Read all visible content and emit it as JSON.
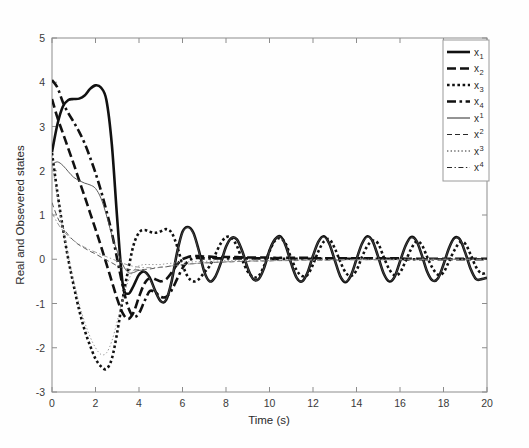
{
  "figure": {
    "background": "#ffffff",
    "axis_color": "#8c8c8c",
    "curve_color": "#111111"
  },
  "axes": {
    "xlabel": "Time (s)",
    "ylabel": "Real and Obsevered states",
    "xticks": [
      "0",
      "2",
      "4",
      "6",
      "8",
      "10",
      "12",
      "14",
      "16",
      "18",
      "20"
    ],
    "yticks": [
      "5",
      "4",
      "3",
      "2",
      "1",
      "0",
      "-1",
      "-2",
      "-3"
    ]
  },
  "legend": {
    "entries": [
      {
        "base": "x",
        "sub": "1",
        "sup": "",
        "style": "solid",
        "weight": "thick"
      },
      {
        "base": "x",
        "sub": "2",
        "sup": "",
        "style": "dashed",
        "weight": "thick"
      },
      {
        "base": "x",
        "sub": "3",
        "sup": "",
        "style": "dotted",
        "weight": "thick"
      },
      {
        "base": "x",
        "sub": "4",
        "sup": "",
        "style": "dashdot",
        "weight": "thick"
      },
      {
        "base": "x",
        "sub": "",
        "sup": "1",
        "style": "solid",
        "weight": "thin"
      },
      {
        "base": "x",
        "sub": "",
        "sup": "2",
        "style": "dashed",
        "weight": "thin"
      },
      {
        "base": "x",
        "sub": "",
        "sup": "3",
        "style": "dotted",
        "weight": "thin"
      },
      {
        "base": "x",
        "sub": "",
        "sup": "4",
        "style": "dashdot",
        "weight": "thin"
      }
    ]
  },
  "chart_data": {
    "type": "line",
    "title": "",
    "xlabel": "Time (s)",
    "ylabel": "Real and Obsevered states",
    "xlim": [
      0,
      20
    ],
    "ylim": [
      -3,
      5
    ],
    "xticks": [
      0,
      2,
      4,
      6,
      8,
      10,
      12,
      14,
      16,
      18,
      20
    ],
    "yticks": [
      -3,
      -2,
      -1,
      0,
      1,
      2,
      3,
      4,
      5
    ],
    "grid": false,
    "legend_position": "top-right",
    "x": [
      0,
      0.25,
      0.5,
      0.75,
      1,
      1.25,
      1.5,
      1.75,
      2,
      2.25,
      2.5,
      2.75,
      3,
      3.25,
      3.5,
      3.75,
      4,
      4.25,
      4.5,
      4.75,
      5,
      5.25,
      5.5,
      5.75,
      6,
      6.25,
      6.5,
      6.75,
      7,
      7.25,
      7.5,
      7.75,
      8,
      8.25,
      8.5,
      8.75,
      9,
      9.25,
      9.5,
      9.75,
      10,
      10.25,
      10.5,
      10.75,
      11,
      11.25,
      11.5,
      11.75,
      12,
      12.25,
      12.5,
      12.75,
      13,
      13.25,
      13.5,
      13.75,
      14,
      14.25,
      14.5,
      14.75,
      15,
      15.25,
      15.5,
      15.75,
      16,
      16.25,
      16.5,
      16.75,
      17,
      17.25,
      17.5,
      17.75,
      18,
      18.25,
      18.5,
      18.75,
      19,
      19.25,
      19.5,
      19.75,
      20
    ],
    "series": [
      {
        "name": "x_1",
        "label": "x1",
        "kind": "real",
        "style": "solid",
        "weight": "thick",
        "values": [
          2.42,
          3.05,
          3.45,
          3.6,
          3.62,
          3.63,
          3.7,
          3.85,
          3.93,
          3.88,
          3.6,
          2.6,
          0.9,
          -0.55,
          -0.78,
          -0.6,
          -0.35,
          -0.28,
          -0.42,
          -0.72,
          -0.95,
          -0.92,
          -0.5,
          0.15,
          0.62,
          0.73,
          0.6,
          0.2,
          -0.28,
          -0.5,
          -0.4,
          -0.1,
          0.28,
          0.48,
          0.45,
          0.18,
          -0.2,
          -0.45,
          -0.45,
          -0.2,
          0.2,
          0.45,
          0.52,
          0.3,
          -0.1,
          -0.42,
          -0.5,
          -0.3,
          0.08,
          0.4,
          0.52,
          0.35,
          -0.02,
          -0.38,
          -0.52,
          -0.36,
          0.0,
          0.35,
          0.52,
          0.4,
          0.05,
          -0.32,
          -0.5,
          -0.4,
          -0.05,
          0.3,
          0.5,
          0.42,
          0.1,
          -0.28,
          -0.48,
          -0.43,
          -0.12,
          0.25,
          0.48,
          0.45,
          0.15,
          -0.22,
          -0.45,
          -0.45,
          -0.42
        ]
      },
      {
        "name": "x_2",
        "label": "x2",
        "kind": "real",
        "style": "dashed",
        "weight": "thick",
        "values": [
          3.62,
          3.2,
          2.85,
          2.5,
          2.15,
          1.78,
          1.42,
          1.05,
          0.68,
          0.3,
          -0.1,
          -0.5,
          -0.9,
          -1.22,
          -1.35,
          -1.2,
          -0.85,
          -0.55,
          -0.42,
          -0.45,
          -0.5,
          -0.45,
          -0.3,
          -0.12,
          0.0,
          0.05,
          0.07,
          0.07,
          0.06,
          0.06,
          0.05,
          0.05,
          0.05,
          0.05,
          0.05,
          0.04,
          0.04,
          0.04,
          0.04,
          0.04,
          0.04,
          0.03,
          0.03,
          0.03,
          0.03,
          0.03,
          0.03,
          0.03,
          0.03,
          0.02,
          0.02,
          0.02,
          0.02,
          0.02,
          0.02,
          0.02,
          0.02,
          0.02,
          0.02,
          0.02,
          0.02,
          0.02,
          0.02,
          0.02,
          0.02,
          0.01,
          0.01,
          0.01,
          0.01,
          0.01,
          0.01,
          0.01,
          0.01,
          0.01,
          0.01,
          0.01,
          0.01,
          0.01,
          0.01,
          0.01,
          0.01
        ]
      },
      {
        "name": "x_3",
        "label": "x3",
        "kind": "real",
        "style": "dotted",
        "weight": "thick",
        "values": [
          2.4,
          1.5,
          0.7,
          0.0,
          -0.6,
          -1.15,
          -1.6,
          -1.95,
          -2.25,
          -2.42,
          -2.48,
          -2.25,
          -1.65,
          -0.9,
          -0.25,
          0.32,
          0.6,
          0.66,
          0.62,
          0.6,
          0.63,
          0.68,
          0.6,
          0.3,
          -0.12,
          -0.4,
          -0.5,
          -0.45,
          -0.3,
          -0.15,
          0.1,
          0.35,
          0.5,
          0.48,
          0.3,
          -0.02,
          -0.28,
          -0.4,
          -0.38,
          -0.15,
          0.18,
          0.42,
          0.47,
          0.35,
          0.02,
          -0.25,
          -0.38,
          -0.35,
          -0.12,
          0.18,
          0.4,
          0.45,
          0.25,
          -0.05,
          -0.3,
          -0.38,
          -0.25,
          0.05,
          0.3,
          0.42,
          0.35,
          0.05,
          -0.22,
          -0.36,
          -0.3,
          -0.05,
          0.22,
          0.4,
          0.33,
          0.05,
          -0.2,
          -0.35,
          -0.3,
          -0.05,
          0.2,
          0.38,
          0.35,
          0.1,
          -0.18,
          -0.32,
          -0.3
        ]
      },
      {
        "name": "x_4",
        "label": "x4",
        "kind": "real",
        "style": "dashdot",
        "weight": "thick",
        "values": [
          4.05,
          3.88,
          3.55,
          3.3,
          3.1,
          2.88,
          2.62,
          2.3,
          1.95,
          1.55,
          1.1,
          0.6,
          0.0,
          -0.6,
          -1.08,
          -1.3,
          -1.22,
          -0.95,
          -0.72,
          -0.75,
          -0.85,
          -0.85,
          -0.7,
          -0.45,
          -0.2,
          -0.05,
          0.02,
          0.03,
          0.02,
          0.02,
          0.02,
          0.02,
          0.02,
          0.02,
          0.02,
          0.02,
          0.02,
          0.02,
          0.02,
          0.02,
          0.02,
          0.01,
          0.01,
          0.01,
          0.01,
          0.01,
          0.01,
          0.01,
          0.01,
          0.01,
          0.01,
          0.01,
          0.01,
          0.01,
          0.01,
          0.01,
          0.01,
          0.01,
          0.01,
          0.01,
          0.01,
          0.01,
          0.01,
          0.01,
          0.01,
          0.0,
          0.0,
          0.0,
          0.0,
          0.0,
          0.0,
          0.0,
          0.0,
          0.0,
          0.0,
          0.0,
          0.0,
          0.0,
          0.0,
          0.0,
          0.0
        ]
      },
      {
        "name": "x^1",
        "label": "x1-obs",
        "kind": "observed",
        "style": "solid",
        "weight": "thin",
        "values": [
          2.15,
          2.2,
          2.12,
          1.98,
          1.85,
          1.78,
          1.72,
          1.68,
          1.6,
          1.38,
          1.0,
          0.55,
          0.18,
          -0.12,
          -0.3,
          -0.3,
          -0.25,
          -0.28,
          -0.45,
          -0.72,
          -0.95,
          -0.9,
          -0.48,
          0.15,
          0.6,
          0.72,
          0.58,
          0.18,
          -0.28,
          -0.5,
          -0.4,
          -0.1,
          0.28,
          0.48,
          0.45,
          0.18,
          -0.2,
          -0.45,
          -0.45,
          -0.2,
          0.2,
          0.45,
          0.5,
          0.3,
          -0.1,
          -0.42,
          -0.5,
          -0.3,
          0.08,
          0.4,
          0.5,
          0.35,
          -0.02,
          -0.38,
          -0.5,
          -0.36,
          0.0,
          0.35,
          0.5,
          0.4,
          0.05,
          -0.32,
          -0.48,
          -0.4,
          -0.05,
          0.3,
          0.48,
          0.42,
          0.1,
          -0.28,
          -0.48,
          -0.43,
          -0.12,
          0.25,
          0.46,
          0.45,
          0.15,
          -0.22,
          -0.45,
          -0.45,
          -0.42
        ]
      },
      {
        "name": "x^2",
        "label": "x2-obs",
        "kind": "observed",
        "style": "dashed",
        "weight": "thin",
        "values": [
          1.28,
          0.95,
          0.72,
          0.55,
          0.42,
          0.32,
          0.25,
          0.18,
          0.12,
          0.05,
          -0.02,
          -0.08,
          -0.15,
          -0.2,
          -0.23,
          -0.24,
          -0.24,
          -0.23,
          -0.22,
          -0.2,
          -0.18,
          -0.17,
          -0.15,
          -0.13,
          -0.12,
          -0.11,
          -0.1,
          -0.09,
          -0.08,
          -0.08,
          -0.07,
          -0.07,
          -0.06,
          -0.06,
          -0.05,
          -0.05,
          -0.05,
          -0.04,
          -0.04,
          -0.04,
          -0.04,
          -0.03,
          -0.03,
          -0.03,
          -0.03,
          -0.03,
          -0.02,
          -0.02,
          -0.02,
          -0.02,
          -0.02,
          -0.02,
          -0.02,
          -0.02,
          -0.01,
          -0.01,
          -0.01,
          -0.01,
          -0.01,
          -0.01,
          -0.01,
          -0.01,
          -0.01,
          -0.01,
          -0.01,
          -0.01,
          -0.01,
          -0.01,
          -0.01,
          0.0,
          0.0,
          0.0,
          0.0,
          0.0,
          0.0,
          0.0,
          0.0,
          0.0,
          0.0,
          0.0,
          0.0
        ]
      },
      {
        "name": "x^3",
        "label": "x3-obs",
        "kind": "observed",
        "style": "dotted",
        "weight": "thin",
        "values": [
          2.18,
          1.4,
          0.68,
          0.05,
          -0.5,
          -1.0,
          -1.42,
          -1.75,
          -2.0,
          -2.15,
          -2.12,
          -1.85,
          -1.4,
          -0.9,
          -0.5,
          -0.25,
          -0.15,
          -0.12,
          -0.12,
          -0.12,
          -0.12,
          -0.1,
          -0.09,
          -0.08,
          -0.07,
          -0.06,
          -0.06,
          -0.05,
          -0.05,
          -0.04,
          -0.04,
          -0.04,
          -0.03,
          -0.03,
          -0.03,
          -0.03,
          -0.02,
          -0.02,
          -0.02,
          -0.02,
          -0.02,
          -0.02,
          -0.02,
          -0.01,
          -0.01,
          -0.01,
          -0.01,
          -0.01,
          -0.01,
          -0.01,
          -0.01,
          -0.01,
          -0.01,
          -0.01,
          -0.01,
          -0.01,
          -0.01,
          0.0,
          0.0,
          0.0,
          0.0,
          0.0,
          0.0,
          0.0,
          0.0,
          0.0,
          0.0,
          0.0,
          0.0,
          0.0,
          0.0,
          0.0,
          0.0,
          0.0,
          0.0,
          0.0,
          0.0,
          0.0,
          0.0,
          0.0,
          0.0
        ]
      },
      {
        "name": "x^4",
        "label": "x4-obs",
        "kind": "observed",
        "style": "dashdot",
        "weight": "thin",
        "values": [
          1.05,
          0.82,
          0.65,
          0.52,
          0.42,
          0.34,
          0.27,
          0.21,
          0.16,
          0.11,
          0.06,
          0.01,
          -0.04,
          -0.09,
          -0.13,
          -0.16,
          -0.18,
          -0.19,
          -0.19,
          -0.19,
          -0.18,
          -0.17,
          -0.15,
          -0.14,
          -0.12,
          -0.11,
          -0.1,
          -0.09,
          -0.08,
          -0.08,
          -0.07,
          -0.06,
          -0.06,
          -0.05,
          -0.05,
          -0.05,
          -0.04,
          -0.04,
          -0.04,
          -0.03,
          -0.03,
          -0.03,
          -0.03,
          -0.03,
          -0.02,
          -0.02,
          -0.02,
          -0.02,
          -0.02,
          -0.02,
          -0.02,
          -0.01,
          -0.01,
          -0.01,
          -0.01,
          -0.01,
          -0.01,
          -0.01,
          -0.01,
          -0.01,
          -0.01,
          -0.01,
          -0.01,
          -0.01,
          -0.01,
          0.0,
          0.0,
          0.0,
          0.0,
          0.0,
          0.0,
          0.0,
          0.0,
          0.0,
          0.0,
          0.0,
          0.0,
          0.0,
          0.0,
          0.0,
          0.0
        ]
      }
    ]
  }
}
